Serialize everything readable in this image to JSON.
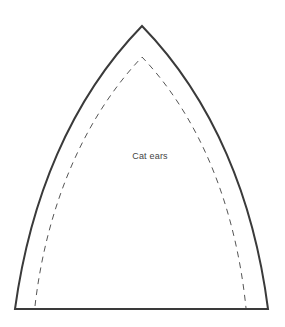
{
  "pattern": {
    "label": "Cat ears",
    "colors": {
      "outline": "#3a3a3a",
      "seam_line": "#555555",
      "background": "#ffffff",
      "label_text": "#444444"
    },
    "shapes": {
      "outer_cut_line": "solid",
      "inner_seam_line": "dashed"
    }
  }
}
